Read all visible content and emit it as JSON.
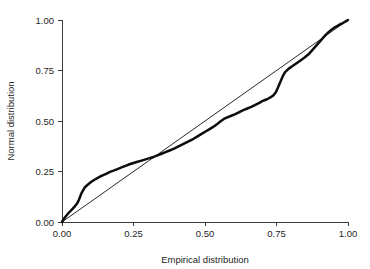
{
  "chart_data": {
    "type": "line",
    "title": "",
    "subtitle": "",
    "xlabel": "Empirical distribution",
    "ylabel": "Normal distribution",
    "xlim": [
      0.0,
      1.0
    ],
    "ylim": [
      0.0,
      1.0
    ],
    "grid": false,
    "legend": "none",
    "xticks": [
      0.0,
      0.25,
      0.5,
      0.75,
      1.0
    ],
    "yticks": [
      0.0,
      0.25,
      0.5,
      0.75,
      1.0
    ],
    "xticklabels": [
      "0.00",
      "0.25",
      "0.50",
      "0.75",
      "1.00"
    ],
    "yticklabels": [
      "0.00",
      "0.25",
      "0.50",
      "0.75",
      "1.00"
    ],
    "colors": {
      "curve": "#0d0d0d",
      "reference_line": "#111111",
      "axis": "#3a3a3a",
      "text": "#262626",
      "background": "#ffffff"
    },
    "series": [
      {
        "name": "P-P curve",
        "type": "line",
        "x": [
          0.0,
          0.005,
          0.012,
          0.02,
          0.028,
          0.036,
          0.044,
          0.052,
          0.058,
          0.063,
          0.068,
          0.074,
          0.08,
          0.088,
          0.096,
          0.104,
          0.112,
          0.122,
          0.132,
          0.144,
          0.156,
          0.168,
          0.18,
          0.194,
          0.208,
          0.222,
          0.236,
          0.25,
          0.264,
          0.278,
          0.292,
          0.306,
          0.32,
          0.334,
          0.348,
          0.362,
          0.376,
          0.39,
          0.404,
          0.418,
          0.432,
          0.446,
          0.46,
          0.474,
          0.488,
          0.502,
          0.516,
          0.53,
          0.544,
          0.556,
          0.566,
          0.578,
          0.592,
          0.606,
          0.62,
          0.634,
          0.648,
          0.662,
          0.676,
          0.69,
          0.7,
          0.71,
          0.72,
          0.73,
          0.74,
          0.748,
          0.754,
          0.76,
          0.766,
          0.772,
          0.78,
          0.792,
          0.806,
          0.82,
          0.834,
          0.848,
          0.862,
          0.872,
          0.882,
          0.892,
          0.902,
          0.912,
          0.922,
          0.932,
          0.942,
          0.952,
          0.962,
          0.972,
          0.982,
          0.992,
          1.0
        ],
        "y": [
          0.0,
          0.012,
          0.026,
          0.04,
          0.052,
          0.064,
          0.076,
          0.09,
          0.106,
          0.124,
          0.142,
          0.158,
          0.172,
          0.182,
          0.192,
          0.2,
          0.208,
          0.216,
          0.224,
          0.232,
          0.24,
          0.248,
          0.254,
          0.262,
          0.27,
          0.278,
          0.286,
          0.292,
          0.298,
          0.304,
          0.31,
          0.316,
          0.322,
          0.33,
          0.338,
          0.346,
          0.354,
          0.362,
          0.372,
          0.382,
          0.392,
          0.402,
          0.412,
          0.424,
          0.436,
          0.448,
          0.46,
          0.472,
          0.486,
          0.5,
          0.51,
          0.518,
          0.526,
          0.534,
          0.544,
          0.554,
          0.562,
          0.57,
          0.58,
          0.59,
          0.598,
          0.604,
          0.61,
          0.618,
          0.628,
          0.644,
          0.662,
          0.682,
          0.702,
          0.722,
          0.742,
          0.758,
          0.772,
          0.786,
          0.8,
          0.814,
          0.83,
          0.846,
          0.862,
          0.878,
          0.894,
          0.91,
          0.926,
          0.94,
          0.952,
          0.962,
          0.97,
          0.978,
          0.985,
          0.993,
          1.0
        ]
      },
      {
        "name": "Reference line",
        "type": "line",
        "x": [
          0.0,
          1.0
        ],
        "y": [
          0.0,
          1.0
        ]
      }
    ],
    "annotations": []
  }
}
